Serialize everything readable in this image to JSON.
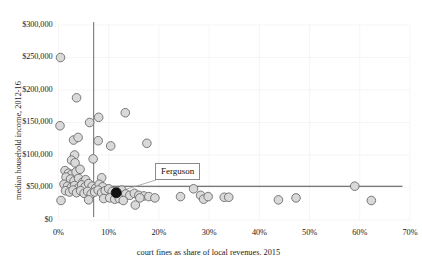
{
  "chart_data": {
    "type": "scatter",
    "title": "",
    "xlabel": "court fines as share of local revenues. 2015",
    "ylabel": "median household income, 2012-16",
    "xlim": [
      0,
      70
    ],
    "ylim": [
      0,
      300000
    ],
    "xticks": [
      "0%",
      "10%",
      "20%",
      "30%",
      "40%",
      "50%",
      "60%",
      "70%"
    ],
    "xtick_values": [
      0,
      10,
      20,
      30,
      40,
      50,
      60,
      70
    ],
    "yticks": [
      "$0",
      "$50,000",
      "$100,000",
      "$150,000",
      "$200,000",
      "$250,000",
      "$300,000"
    ],
    "ytick_values": [
      0,
      50000,
      100000,
      150000,
      200000,
      250000,
      300000
    ],
    "grid": true,
    "legend": "none",
    "reference_lines": [
      {
        "name": "vertical-median-line",
        "orientation": "vertical",
        "x": 7.0,
        "color": "#7a7a7a"
      },
      {
        "name": "horizontal-median-line",
        "orientation": "horizontal",
        "y": 52000,
        "color": "#4d4d4d"
      }
    ],
    "annotations": [
      {
        "label": "Ferguson",
        "x": 11.5,
        "y": 42000
      }
    ],
    "marker_fill": "#d9d9d9",
    "marker_stroke": "#6b6b6b",
    "highlight_fill": "#111111",
    "points": [
      {
        "x": 0.4,
        "y": 250000
      },
      {
        "x": 3.6,
        "y": 188000
      },
      {
        "x": 6.2,
        "y": 150000
      },
      {
        "x": 8.0,
        "y": 158000
      },
      {
        "x": 13.3,
        "y": 165000
      },
      {
        "x": 0.3,
        "y": 145000
      },
      {
        "x": 3.0,
        "y": 123000
      },
      {
        "x": 3.9,
        "y": 127000
      },
      {
        "x": 7.9,
        "y": 122000
      },
      {
        "x": 10.4,
        "y": 114000
      },
      {
        "x": 17.6,
        "y": 118000
      },
      {
        "x": 3.2,
        "y": 100000
      },
      {
        "x": 2.6,
        "y": 92000
      },
      {
        "x": 3.3,
        "y": 88000
      },
      {
        "x": 6.9,
        "y": 94000
      },
      {
        "x": 1.3,
        "y": 76000
      },
      {
        "x": 2.0,
        "y": 72000
      },
      {
        "x": 2.6,
        "y": 70000
      },
      {
        "x": 3.5,
        "y": 74000
      },
      {
        "x": 4.3,
        "y": 78000
      },
      {
        "x": 1.5,
        "y": 66000
      },
      {
        "x": 2.4,
        "y": 63000
      },
      {
        "x": 3.1,
        "y": 60000
      },
      {
        "x": 4.0,
        "y": 64000
      },
      {
        "x": 4.8,
        "y": 58000
      },
      {
        "x": 5.4,
        "y": 62000
      },
      {
        "x": 8.6,
        "y": 65000
      },
      {
        "x": 1.1,
        "y": 55000
      },
      {
        "x": 1.8,
        "y": 52000
      },
      {
        "x": 2.5,
        "y": 50000
      },
      {
        "x": 3.2,
        "y": 53000
      },
      {
        "x": 3.9,
        "y": 49000
      },
      {
        "x": 4.6,
        "y": 54000
      },
      {
        "x": 5.3,
        "y": 51000
      },
      {
        "x": 6.0,
        "y": 56000
      },
      {
        "x": 6.7,
        "y": 52000
      },
      {
        "x": 7.4,
        "y": 49000
      },
      {
        "x": 8.1,
        "y": 55000
      },
      {
        "x": 8.8,
        "y": 51000
      },
      {
        "x": 1.4,
        "y": 45000
      },
      {
        "x": 2.2,
        "y": 43000
      },
      {
        "x": 2.9,
        "y": 46000
      },
      {
        "x": 3.6,
        "y": 42000
      },
      {
        "x": 4.4,
        "y": 45000
      },
      {
        "x": 5.1,
        "y": 41000
      },
      {
        "x": 5.8,
        "y": 44000
      },
      {
        "x": 6.5,
        "y": 40000
      },
      {
        "x": 7.2,
        "y": 43000
      },
      {
        "x": 7.9,
        "y": 46000
      },
      {
        "x": 8.6,
        "y": 42000
      },
      {
        "x": 9.3,
        "y": 45000
      },
      {
        "x": 10.0,
        "y": 48000
      },
      {
        "x": 10.7,
        "y": 44000
      },
      {
        "x": 12.6,
        "y": 46000
      },
      {
        "x": 13.4,
        "y": 40000
      },
      {
        "x": 14.2,
        "y": 38000
      },
      {
        "x": 15.1,
        "y": 41000
      },
      {
        "x": 16.0,
        "y": 38000
      },
      {
        "x": 17.0,
        "y": 37000
      },
      {
        "x": 18.0,
        "y": 36000
      },
      {
        "x": 0.5,
        "y": 30000
      },
      {
        "x": 6.0,
        "y": 31000
      },
      {
        "x": 9.0,
        "y": 33000
      },
      {
        "x": 10.2,
        "y": 34000
      },
      {
        "x": 11.2,
        "y": 32000
      },
      {
        "x": 12.1,
        "y": 33000
      },
      {
        "x": 12.9,
        "y": 30000
      },
      {
        "x": 15.3,
        "y": 23000
      },
      {
        "x": 16.2,
        "y": 34000
      },
      {
        "x": 19.2,
        "y": 34000
      },
      {
        "x": 24.3,
        "y": 36000
      },
      {
        "x": 26.9,
        "y": 48000
      },
      {
        "x": 28.3,
        "y": 38000
      },
      {
        "x": 28.9,
        "y": 32000
      },
      {
        "x": 29.8,
        "y": 36000
      },
      {
        "x": 33.0,
        "y": 35000
      },
      {
        "x": 33.9,
        "y": 35000
      },
      {
        "x": 43.8,
        "y": 31000
      },
      {
        "x": 47.3,
        "y": 34000
      },
      {
        "x": 59.0,
        "y": 52000
      },
      {
        "x": 62.3,
        "y": 30000
      }
    ]
  },
  "axis": {
    "y_title": "median household income, 2012-16",
    "x_title": "court fines as share of local revenues. 2015"
  },
  "callout": {
    "ferguson_label": "Ferguson"
  }
}
